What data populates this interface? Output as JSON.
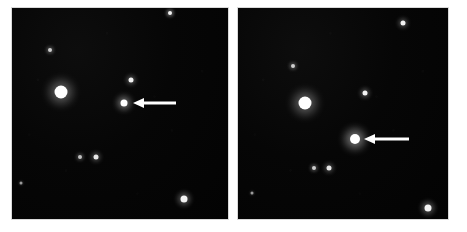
{
  "figure": {
    "name": "two-panel-star-field-comparison",
    "background_color": "#ffffff",
    "width": 467,
    "height": 232,
    "panel_gap_color": "#ffffff"
  },
  "panels": [
    {
      "id": "left-plate",
      "label": "left-star-field-plate",
      "x": 12,
      "y": 8,
      "width": 216,
      "height": 211,
      "sky_color": "#050505",
      "target": {
        "label": "arrowed-object-faint",
        "x": 124,
        "y": 103,
        "diameter": 7,
        "brightness": "faint",
        "color": "#ffffff"
      },
      "arrow": {
        "label": "pointer-arrow-left-panel",
        "tip_x": 133,
        "tail_x": 176,
        "y": 103,
        "color": "#ffffff"
      },
      "stars": [
        {
          "x": 170,
          "y": 13,
          "d": 4,
          "i": 0.95
        },
        {
          "x": 50,
          "y": 50,
          "d": 4,
          "i": 0.8
        },
        {
          "x": 131,
          "y": 80,
          "d": 5,
          "i": 0.95
        },
        {
          "x": 61,
          "y": 92,
          "d": 13,
          "i": 1.0
        },
        {
          "x": 80,
          "y": 157,
          "d": 4,
          "i": 0.75
        },
        {
          "x": 96,
          "y": 157,
          "d": 5,
          "i": 0.9
        },
        {
          "x": 21,
          "y": 183,
          "d": 3,
          "i": 0.6
        },
        {
          "x": 184,
          "y": 199,
          "d": 7,
          "i": 0.95
        }
      ]
    },
    {
      "id": "right-plate",
      "label": "right-star-field-plate",
      "x": 238,
      "y": 8,
      "width": 210,
      "height": 211,
      "sky_color": "#050505",
      "target": {
        "label": "arrowed-object-bright",
        "x": 355,
        "y": 139,
        "diameter": 10,
        "brightness": "bright",
        "color": "#ffffff"
      },
      "arrow": {
        "label": "pointer-arrow-right-panel",
        "tip_x": 364,
        "tail_x": 409,
        "y": 139,
        "color": "#ffffff"
      },
      "stars": [
        {
          "x": 403,
          "y": 23,
          "d": 5,
          "i": 0.95
        },
        {
          "x": 293,
          "y": 66,
          "d": 4,
          "i": 0.8
        },
        {
          "x": 365,
          "y": 93,
          "d": 5,
          "i": 0.95
        },
        {
          "x": 305,
          "y": 103,
          "d": 13,
          "i": 1.0
        },
        {
          "x": 314,
          "y": 168,
          "d": 4,
          "i": 0.8
        },
        {
          "x": 329,
          "y": 168,
          "d": 5,
          "i": 0.9
        },
        {
          "x": 252,
          "y": 193,
          "d": 3,
          "i": 0.6
        },
        {
          "x": 428,
          "y": 208,
          "d": 7,
          "i": 0.95
        }
      ]
    }
  ]
}
